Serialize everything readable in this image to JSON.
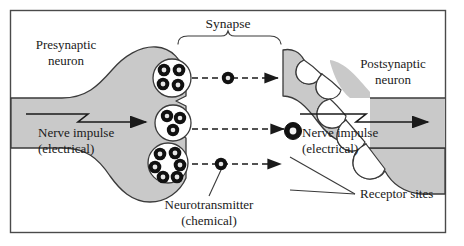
{
  "figure": {
    "title_implied": "Synapse diagram",
    "border_color": "#4a4a4a",
    "neuron_fill": "#c9c9c9",
    "neuron_stroke": "#3a3a3a",
    "vesicle_fill": "#ffffff",
    "neurotransmitter_fill": "#111111",
    "background": "#ffffff",
    "text_color": "#1a1a1a"
  },
  "labels": {
    "synapse": "Synapse",
    "presynaptic_line1": "Presynaptic",
    "presynaptic_line2": "neuron",
    "postsynaptic_line1": "Postsynaptic",
    "postsynaptic_line2": "neuron",
    "nerve_impulse_left_line1": "Nerve impulse",
    "nerve_impulse_left_line2": "(electrical)",
    "nerve_impulse_right_line1": "Nerve impulse",
    "nerve_impulse_right_line2": "(electrical)",
    "neurotransmitter_line1": "Neurotransmitter",
    "neurotransmitter_line2": "(chemical)",
    "receptor_sites": "Receptor sites"
  },
  "structures": {
    "vesicle_count": 3,
    "vesicles": [
      {
        "id": "vesicle-top",
        "granules": 4
      },
      {
        "id": "vesicle-middle",
        "granules": 3
      },
      {
        "id": "vesicle-bottom",
        "granules": 6
      }
    ],
    "receptor_site_count": 5,
    "diffusion_arrow_count": 3,
    "impulse_arrow_count": 2,
    "docked_neurotransmitter": 1,
    "free_neurotransmitters": 3
  }
}
